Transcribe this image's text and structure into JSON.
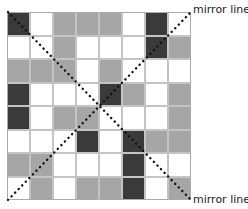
{
  "diagram": {
    "rows": 8,
    "cols": 8,
    "legend": {
      "w": "white",
      "g": "gray",
      "d": "dark"
    },
    "colors": {
      "white": "#ffffff",
      "gray": "#a6a6a6",
      "dark": "#3a3a3a",
      "line": "#111111"
    },
    "cells": [
      [
        "d",
        "w",
        "g",
        "g",
        "g",
        "w",
        "d",
        "w"
      ],
      [
        "w",
        "w",
        "g",
        "w",
        "w",
        "w",
        "d",
        "g"
      ],
      [
        "g",
        "g",
        "g",
        "w",
        "g",
        "w",
        "w",
        "w"
      ],
      [
        "d",
        "w",
        "w",
        "w",
        "d",
        "g",
        "w",
        "g"
      ],
      [
        "d",
        "w",
        "g",
        "g",
        "w",
        "w",
        "w",
        "g"
      ],
      [
        "w",
        "w",
        "w",
        "d",
        "w",
        "d",
        "g",
        "g"
      ],
      [
        "g",
        "g",
        "w",
        "w",
        "w",
        "d",
        "w",
        "w"
      ],
      [
        "w",
        "g",
        "w",
        "g",
        "g",
        "d",
        "w",
        "g"
      ]
    ],
    "mirror_lines": [
      {
        "label": "mirror line",
        "from": "bottom-left",
        "to": "top-right"
      },
      {
        "label": "mirror line",
        "from": "top-left",
        "to": "bottom-right"
      }
    ]
  }
}
